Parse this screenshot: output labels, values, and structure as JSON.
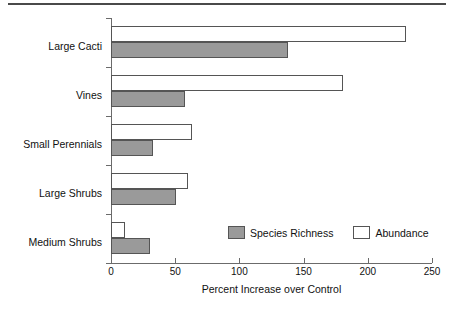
{
  "chart_data": {
    "type": "bar",
    "orientation": "horizontal",
    "title": "",
    "xlabel": "Percent Increase over Control",
    "ylabel": "",
    "xlim": [
      0,
      250
    ],
    "xticks": [
      0,
      50,
      100,
      150,
      200,
      250
    ],
    "xtick_labels": [
      "0",
      "50",
      "100",
      "150",
      "200",
      "250"
    ],
    "grid": false,
    "legend_position": "inside-bottom-right",
    "categories": [
      "Large Cacti",
      "Vines",
      "Small Perennials",
      "Large Shrubs",
      "Medium Shrubs"
    ],
    "series": [
      {
        "name": "Species Richness",
        "color": "#9a9a9a",
        "values": [
          138,
          58,
          33,
          51,
          30
        ]
      },
      {
        "name": "Abundance",
        "color": "#ffffff",
        "values": [
          230,
          181,
          63,
          60,
          11
        ]
      }
    ]
  },
  "axes": {
    "x_title": "Percent Increase over Control",
    "tick_labels": [
      "0",
      "50",
      "100",
      "150",
      "200",
      "250"
    ],
    "category_labels": [
      "Large Cacti",
      "Vines",
      "Small Perennials",
      "Large Shrubs",
      "Medium Shrubs"
    ]
  },
  "legend": {
    "items": [
      {
        "label": "Species Richness",
        "swatch": "gray-filled-swatch"
      },
      {
        "label": "Abundance",
        "swatch": "white-open-swatch"
      }
    ]
  },
  "colors": {
    "richness_fill": "#9a9a9a",
    "abundance_fill": "#ffffff",
    "outline": "#555555",
    "axis": "#6b6b6b",
    "rule": "#4a4a4a"
  }
}
